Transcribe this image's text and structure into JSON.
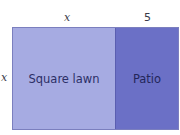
{
  "diagram": {
    "dimensions": {
      "top_left_label": "x",
      "top_right_label": "5",
      "side_label": "x"
    },
    "regions": [
      {
        "label": "Square lawn",
        "color": "#a6abe2"
      },
      {
        "label": "Patio",
        "color": "#6b70c6"
      }
    ],
    "border_color": "#7b7fbe"
  }
}
